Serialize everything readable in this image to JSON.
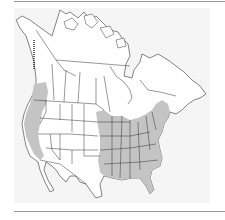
{
  "map": {
    "type": "species-range-map",
    "region": "North America",
    "colors": {
      "page_background": "#ffffff",
      "panel_background": "#f5f5f5",
      "land": "#ffffff",
      "range_fill": "#c4c4c4",
      "border_lines": "#333333",
      "rule_lines": "#9a9a9a"
    },
    "legend": [],
    "range_areas": [
      {
        "name": "eastern-range",
        "description": "Eastern United States from Minnesota/eastern Great Plains and east Texas east to Atlantic coast, north into southern Ontario/Quebec and Maritimes"
      },
      {
        "name": "pacific-coast-range",
        "description": "Pacific coast strip from southern British Columbia through Washington, Oregon and California"
      }
    ]
  }
}
